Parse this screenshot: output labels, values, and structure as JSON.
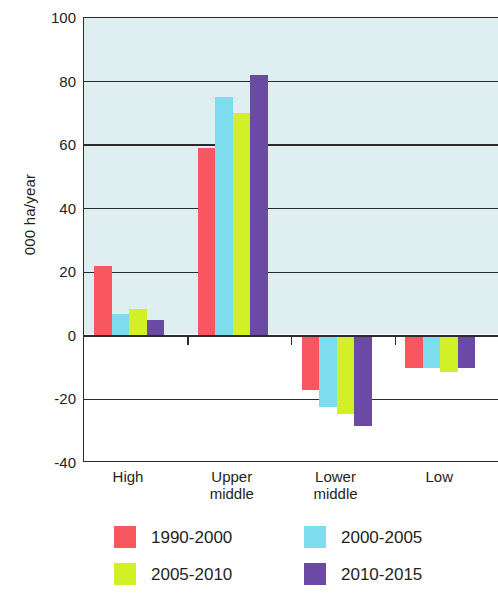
{
  "chart_data": {
    "type": "bar",
    "title": "",
    "subtitle": "",
    "xlabel": "",
    "ylabel": "000 ha/year",
    "categories": [
      "High",
      "Upper\nmiddle",
      "Lower\nmiddle",
      "Low"
    ],
    "ylim": [
      -40,
      100
    ],
    "yticks": [
      100,
      80,
      60,
      40,
      20,
      0,
      -20,
      -40
    ],
    "ytick_labels": [
      "100",
      "80",
      "60",
      "40",
      "20",
      "0",
      "-20",
      "-40"
    ],
    "grid": true,
    "legend_position": "bottom",
    "series": [
      {
        "name": "1990-2000",
        "color": "#f8575f",
        "values": [
          22,
          59,
          -17,
          -10
        ]
      },
      {
        "name": "2000-2005",
        "color": "#7ddcee",
        "values": [
          7,
          75,
          -22.5,
          -10
        ]
      },
      {
        "name": "2005-2010",
        "color": "#d2f026",
        "values": [
          8.5,
          70,
          -24.5,
          -11.5
        ]
      },
      {
        "name": "2010-2015",
        "color": "#6b4aa6",
        "values": [
          5,
          82,
          -28.5,
          -10
        ]
      }
    ]
  },
  "axes": {
    "y_title": "000 ha/year",
    "tick_0": "100",
    "tick_1": "80",
    "tick_2": "60",
    "tick_3": "40",
    "tick_4": "20",
    "tick_5": "0",
    "tick_6": "-20",
    "tick_7": "-40",
    "cat_0": "High",
    "cat_1": "Upper\nmiddle",
    "cat_2": "Lower\nmiddle",
    "cat_3": "Low"
  },
  "legend": {
    "item_0": "1990-2000",
    "item_1": "2000-2005",
    "item_2": "2005-2010",
    "item_3": "2010-2015"
  },
  "colors": {
    "series_1990_2000": "#f8575f",
    "series_2000_2005": "#7ddcee",
    "series_2005_2010": "#d2f026",
    "series_2010_2015": "#6b4aa6",
    "plot_tint": "#dfeef0",
    "axis": "#2b2b2b"
  }
}
